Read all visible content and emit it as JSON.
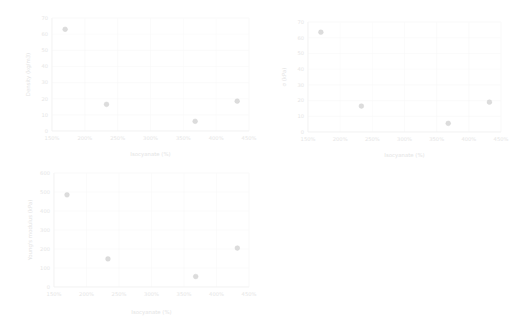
{
  "figure": {
    "background": "#ffffff",
    "marker_color": "#dcdcdc",
    "grid_color": "#f6f6f6",
    "text_color": "#e8e8e8"
  },
  "chart_data": [
    {
      "id": "density-vs-isocyanate",
      "type": "scatter",
      "title": "",
      "xlabel": "Isocyanate (%)",
      "ylabel": "Density (kg/m3)",
      "xlim": [
        150,
        450
      ],
      "ylim": [
        0,
        70
      ],
      "xticks": [
        150,
        200,
        250,
        300,
        350,
        400,
        450
      ],
      "xtick_labels": [
        "150%",
        "200%",
        "250%",
        "300%",
        "350%",
        "400%",
        "450%"
      ],
      "yticks": [
        0,
        10,
        20,
        30,
        40,
        50,
        60,
        70
      ],
      "ytick_labels": [
        "0",
        "10",
        "20",
        "30",
        "40",
        "50",
        "60",
        "70"
      ],
      "grid": true,
      "legend": "none",
      "x": [
        170,
        233,
        368,
        432
      ],
      "y": [
        63,
        16.5,
        6,
        18.5
      ]
    },
    {
      "id": "sigma-vs-isocyanate",
      "type": "scatter",
      "title": "",
      "xlabel": "Isocyanate (%)",
      "ylabel": "σ (kPa)",
      "xlim": [
        150,
        450
      ],
      "ylim": [
        0,
        70
      ],
      "xticks": [
        150,
        200,
        250,
        300,
        350,
        400,
        450
      ],
      "xtick_labels": [
        "150%",
        "200%",
        "250%",
        "300%",
        "350%",
        "400%",
        "450%"
      ],
      "yticks": [
        0,
        10,
        20,
        30,
        40,
        50,
        60,
        70
      ],
      "ytick_labels": [
        "0",
        "10",
        "20",
        "30",
        "40",
        "50",
        "60",
        "70"
      ],
      "grid": true,
      "legend": "none",
      "x": [
        170,
        233,
        368,
        432
      ],
      "y": [
        63.5,
        16.5,
        5.5,
        19
      ]
    },
    {
      "id": "youngs-modulus-vs-isocyanate",
      "type": "scatter",
      "title": "",
      "xlabel": "Isocyanate (%)",
      "ylabel": "Young's modulus (kPa)",
      "xlim": [
        150,
        450
      ],
      "ylim": [
        0,
        600
      ],
      "xticks": [
        150,
        200,
        250,
        300,
        350,
        400,
        450
      ],
      "xtick_labels": [
        "150%",
        "200%",
        "250%",
        "300%",
        "350%",
        "400%",
        "450%"
      ],
      "yticks": [
        0,
        100,
        200,
        300,
        400,
        500,
        600
      ],
      "ytick_labels": [
        "0",
        "100",
        "200",
        "300",
        "400",
        "500",
        "600"
      ],
      "grid": true,
      "legend": "none",
      "x": [
        170,
        233,
        368,
        432
      ],
      "y": [
        485,
        148,
        55,
        205
      ]
    }
  ]
}
